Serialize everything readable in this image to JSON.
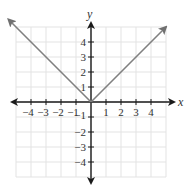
{
  "chart_data": {
    "type": "line",
    "title": "",
    "function": "y = |x|",
    "xlabel": "x",
    "ylabel": "y",
    "xlim": [
      -5,
      5
    ],
    "ylim": [
      -5,
      5
    ],
    "grid": true,
    "legend": null,
    "x_ticks": [
      -4,
      -3,
      -2,
      -1,
      1,
      2,
      3,
      4
    ],
    "x_tick_labels": [
      "−4",
      "−3",
      "−2",
      "−1",
      "1",
      "2",
      "3",
      "4"
    ],
    "y_ticks": [
      4,
      3,
      2,
      1,
      -1,
      -2,
      -3,
      -4
    ],
    "y_tick_labels": [
      "4",
      "3",
      "2",
      "1",
      "−1",
      "−2",
      "−3",
      "−4"
    ],
    "series": [
      {
        "name": "y = |x|",
        "points": [
          [
            -5.5,
            5.5
          ],
          [
            0,
            0
          ],
          [
            5,
            5
          ]
        ],
        "arrows_at_ends": true,
        "color": "#808080"
      }
    ],
    "axis_color": "#1a1a1a",
    "grid_color": "#e3e3e3"
  }
}
